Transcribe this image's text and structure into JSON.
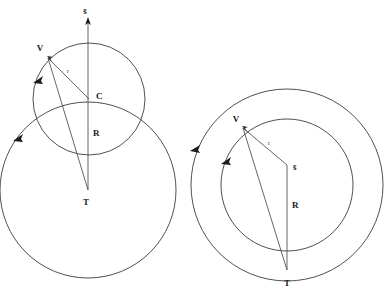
{
  "figure": {
    "background_color": "#ffffff",
    "stroke_color": "#3c3c3c",
    "label_color": "#1a1a1a",
    "width": 385,
    "height": 291
  },
  "panels": [
    {
      "id": "left-panel",
      "name": "rolling-circle-panel",
      "circles": [
        {
          "name": "small-circle",
          "cx": 89,
          "cy": 99,
          "r": 56,
          "label": ""
        },
        {
          "name": "large-circle",
          "cx": 88,
          "cy": 190,
          "r": 88,
          "label": ""
        }
      ],
      "points": [
        {
          "name": "V",
          "label": "V",
          "x": 48,
          "y": 58,
          "label_x": 41,
          "label_y": 52
        },
        {
          "name": "C",
          "label": "C",
          "x": 89,
          "y": 99,
          "label_x": 94,
          "label_y": 98
        },
        {
          "name": "T",
          "label": "T",
          "x": 88,
          "y": 190,
          "label_x": 83,
          "label_y": 203
        }
      ],
      "segments": [
        {
          "name": "radius-r",
          "from": "V",
          "to": "C",
          "label": "r",
          "label_x": 68,
          "label_y": 74
        },
        {
          "name": "chord-VT",
          "from": "V",
          "to": "T",
          "label": ""
        },
        {
          "name": "axis-R",
          "from": "T",
          "to": "C",
          "label": "R",
          "label_x": 92,
          "label_y": 134
        }
      ],
      "vectors": [
        {
          "name": "s-bar-arrow",
          "label": "s̄",
          "label_x": 89,
          "label_y": 12,
          "from_x": 88,
          "from_y": 190,
          "to_x": 88,
          "to_y": 20
        }
      ],
      "arrowheads": [
        {
          "name": "small-circle-direction-arrow",
          "x": 37,
          "y": 79,
          "angle": 118
        },
        {
          "name": "large-circle-direction-arrow",
          "x": 18,
          "y": 137,
          "angle": 118
        }
      ]
    },
    {
      "id": "right-panel",
      "name": "concentric-circle-panel",
      "circles": [
        {
          "name": "outer-circle",
          "cx": 287,
          "cy": 185,
          "r": 96,
          "label": ""
        },
        {
          "name": "inner-circle",
          "cx": 287,
          "cy": 185,
          "r": 66,
          "label": ""
        }
      ],
      "points": [
        {
          "name": "V",
          "label": "V",
          "x": 243,
          "y": 128,
          "label_x": 236,
          "label_y": 124
        },
        {
          "name": "S",
          "label": "s̄",
          "x": 287,
          "y": 165,
          "label_x": 292,
          "label_y": 168
        },
        {
          "name": "T",
          "label": "T",
          "x": 287,
          "y": 270,
          "label_x": 283,
          "label_y": 284
        }
      ],
      "segments": [
        {
          "name": "radius-r",
          "from": "V",
          "to": "S",
          "label": "r",
          "label_x": 268,
          "label_y": 147
        },
        {
          "name": "chord-VT",
          "from": "V",
          "to": "T",
          "label": ""
        },
        {
          "name": "axis-R",
          "from": "S",
          "to": "T",
          "label": "R",
          "label_x": 291,
          "label_y": 206
        }
      ],
      "arrowheads": [
        {
          "name": "outer-circle-direction-arrow",
          "x": 194,
          "y": 148,
          "angle": 112
        },
        {
          "name": "inner-circle-direction-arrow",
          "x": 225,
          "y": 160,
          "angle": 118
        }
      ]
    }
  ],
  "labels": {
    "s_bar": "s̄",
    "r_lower": "r",
    "R_upper": "R",
    "V": "V",
    "C": "C",
    "T": "T"
  }
}
